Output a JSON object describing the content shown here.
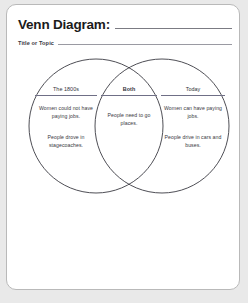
{
  "worksheet": {
    "title": "Venn Diagram:",
    "subtitle": "Title or Topic",
    "title_fill_line": "",
    "subtitle_fill_line": ""
  },
  "diagram": {
    "type": "venn",
    "stroke_color": "#3a3a42",
    "regions": [
      {
        "id": "left",
        "heading": "The 1800s",
        "lines": [
          "Women could not have paying jobs.",
          "People drove in stagecoaches."
        ]
      },
      {
        "id": "center",
        "heading": "Both",
        "lines": [
          "People need to go places."
        ]
      },
      {
        "id": "right",
        "heading": "Today",
        "lines": [
          "Women can have paying jobs.",
          "People drive in cars and buses."
        ]
      }
    ]
  }
}
